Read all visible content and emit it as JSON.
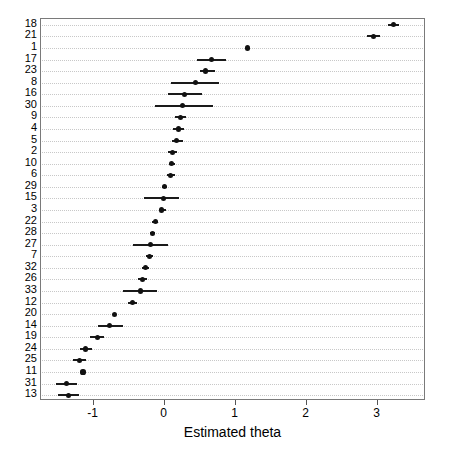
{
  "chart_data": {
    "type": "scatter",
    "title": "",
    "subtitle": "",
    "xlabel": "Estimated theta",
    "ylabel": "",
    "xlim": [
      -1.74,
      3.68
    ],
    "ylim": [
      0,
      33
    ],
    "grid": true,
    "legend": null,
    "orientation": "horizontal-forest-plot",
    "xticks": [
      -1,
      0,
      1,
      2,
      3
    ],
    "xticklabels": [
      "-1",
      "0",
      "1",
      "2",
      "3"
    ],
    "categories": [
      "18",
      "21",
      "1",
      "17",
      "23",
      "8",
      "16",
      "30",
      "9",
      "4",
      "5",
      "2",
      "10",
      "6",
      "29",
      "15",
      "3",
      "22",
      "28",
      "27",
      "7",
      "32",
      "26",
      "33",
      "12",
      "20",
      "14",
      "19",
      "24",
      "25",
      "11",
      "31",
      "13"
    ],
    "values": [
      3.22,
      2.94,
      1.17,
      0.66,
      0.58,
      0.44,
      0.28,
      0.25,
      0.22,
      0.19,
      0.17,
      0.11,
      0.1,
      0.08,
      0.0,
      -0.01,
      -0.04,
      -0.13,
      -0.17,
      -0.2,
      -0.21,
      -0.27,
      -0.31,
      -0.34,
      -0.45,
      -0.7,
      -0.77,
      -0.95,
      -1.11,
      -1.2,
      -1.15,
      -1.38,
      -1.35
    ],
    "ci_low": [
      3.14,
      2.85,
      1.17,
      0.46,
      0.5,
      0.09,
      0.05,
      -0.14,
      0.15,
      0.12,
      0.1,
      0.05,
      0.06,
      0.03,
      -0.03,
      -0.29,
      -0.08,
      -0.18,
      -0.21,
      -0.45,
      -0.26,
      -0.32,
      -0.37,
      -0.59,
      -0.51,
      -0.7,
      -0.94,
      -1.05,
      -1.19,
      -1.29,
      -1.15,
      -1.53,
      -1.5
    ],
    "ci_high": [
      3.3,
      3.03,
      1.17,
      0.86,
      0.71,
      0.77,
      0.53,
      0.68,
      0.3,
      0.28,
      0.26,
      0.18,
      0.15,
      0.14,
      0.04,
      0.2,
      0.02,
      -0.09,
      -0.13,
      0.05,
      -0.16,
      -0.22,
      -0.25,
      -0.1,
      -0.39,
      -0.7,
      -0.59,
      -0.85,
      -1.02,
      -1.11,
      -1.15,
      -1.24,
      -1.2
    ],
    "series": [
      {
        "name": "Estimated theta",
        "point_color": "#111111",
        "errorbar_color": "#1a1a1a"
      }
    ]
  },
  "axis": {
    "xtitle": "Estimated theta",
    "tick_labels": [
      "-1",
      "0",
      "1",
      "2",
      "3"
    ]
  }
}
